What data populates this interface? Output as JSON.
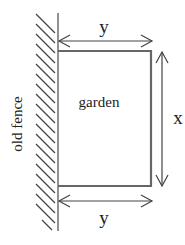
{
  "diagram": {
    "labels": {
      "garden": "garden",
      "fence": "old fence",
      "top_dimension": "y",
      "bottom_dimension": "y",
      "right_dimension": "x"
    },
    "colors": {
      "line": "#555555",
      "text": "#222222",
      "hatch": "#444444"
    }
  }
}
